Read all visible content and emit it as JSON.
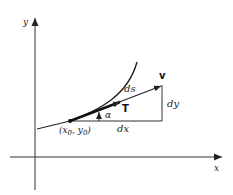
{
  "diagram": {
    "axes": {
      "x_label": "x",
      "y_label": "y"
    },
    "point_label": "(x₀, y₀)",
    "point_label_parts": {
      "open": "(x",
      "sub0": "0",
      "comma": ", y",
      "sub1": "0",
      "close": ")"
    },
    "tangent_vector_label": "v",
    "unit_tangent_label": "T",
    "arc_length_label": "ds",
    "angle_label": "α",
    "dx_label": "dx",
    "dy_label": "dy",
    "colors": {
      "stroke": "#222222",
      "background": "#ffffff"
    }
  }
}
